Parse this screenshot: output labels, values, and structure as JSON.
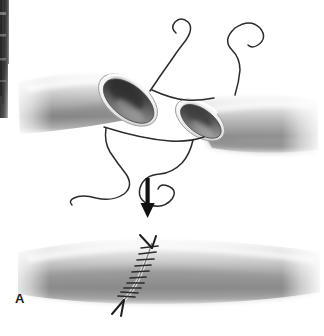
{
  "figure": {
    "panel_label": "A",
    "background_color": "#ffffff",
    "width": 324,
    "height": 336
  },
  "colors": {
    "vessel_light": "#f2f2f2",
    "vessel_mid": "#b8b8b8",
    "vessel_dark": "#6e6e6e",
    "vessel_shadow": "#4a4a4a",
    "lumen_dark": "#3d3d3d",
    "lumen_mid": "#8a8a8a",
    "rim_highlight": "#fbfbfb",
    "suture_stroke": "#2b2b2b",
    "arrow_fill": "#111111",
    "label_color": "#1a1a1a",
    "page_edge_dark": "#4d4d4d",
    "page_edge_darker": "#2e2e2e"
  },
  "scene": {
    "top_panel": {
      "name": "severed-vessel-with-stay-sutures",
      "left_vessel": {
        "label": "left vessel segment",
        "open_end_lumen": "elliptical open lumen facing right"
      },
      "right_vessel": {
        "label": "right vessel segment",
        "open_end_lumen": "elliptical open lumen facing left"
      },
      "sutures": [
        {
          "name": "stay-suture-top-left",
          "form": "curled tail above vessel"
        },
        {
          "name": "stay-suture-top-right",
          "form": "looped tail above vessel"
        },
        {
          "name": "stay-suture-bottom-left",
          "form": "long S-curve tail below vessel"
        },
        {
          "name": "stay-suture-bottom-right",
          "form": "spiral curl tail below vessel"
        },
        {
          "name": "bridging-suture-upper",
          "form": "thread spanning between the two lumen rims"
        },
        {
          "name": "bridging-suture-lower",
          "form": "thread spanning between the two lumen rims"
        }
      ]
    },
    "arrow": {
      "name": "downward-progress-arrow",
      "direction": "down"
    },
    "bottom_panel": {
      "name": "repaired-vessel-with-running-suture",
      "suture_line": {
        "name": "anastomosis-suture-line",
        "orientation": "oblique, upper-right to lower-left",
        "stitch_count": 11
      },
      "needle_marks": [
        {
          "name": "suture-end-arrow-top",
          "position": "top of suture line"
        },
        {
          "name": "suture-end-arrow-bottom",
          "position": "bottom of suture line"
        }
      ]
    },
    "page_edge": {
      "name": "scanned-page-edge",
      "position": "left margin"
    }
  }
}
